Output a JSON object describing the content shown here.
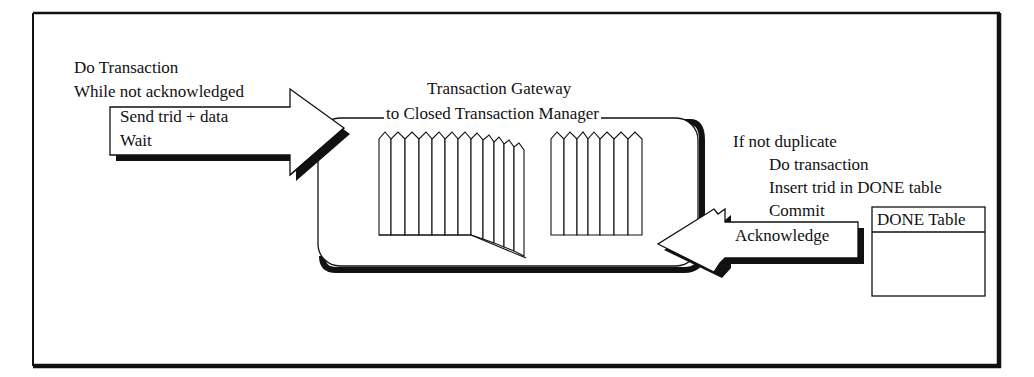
{
  "client": {
    "line1": "Do Transaction",
    "line2": "While not acknowledged",
    "arrow_lines": [
      "Send  trid + data",
      "Wait"
    ]
  },
  "gateway": {
    "title_line1": "Transaction Gateway",
    "title_line2": "to Closed Transaction Manager"
  },
  "server": {
    "condition": "If not duplicate",
    "steps": [
      "Do transaction",
      "Insert trid in DONE table",
      "Commit"
    ],
    "arrow_label": "Acknowledge"
  },
  "done_table": {
    "header": "DONE Table"
  },
  "colors": {
    "ink": "#111111",
    "background": "#ffffff"
  }
}
